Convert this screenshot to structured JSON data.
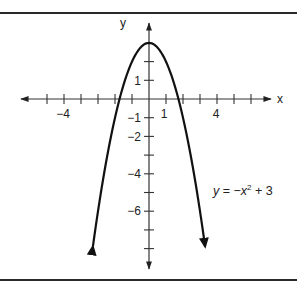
{
  "chart_data": {
    "type": "line",
    "title": "",
    "xlabel": "x",
    "ylabel": "y",
    "xlim": [
      -6.8,
      7.2
    ],
    "ylim": [
      -9,
      3.8
    ],
    "x_ticks": [
      -6,
      -5,
      -4,
      -3,
      -2,
      -1,
      1,
      2,
      3,
      4,
      5,
      6
    ],
    "x_tick_labels": {
      "-4": "−4",
      "1": "1",
      "4": "4"
    },
    "y_ticks": [
      2,
      1,
      -1,
      -2,
      -3,
      -4,
      -5,
      -6,
      -7,
      -8
    ],
    "y_tick_labels": {
      "1": "1",
      "-1": "−1",
      "-2": "−2",
      "-4": "−4",
      "-6": "−6"
    },
    "grid": false,
    "series": [
      {
        "name": "y = −x² + 3",
        "equation": "y = -x^2 + 3",
        "x": [
          -3.3,
          -3,
          -2.5,
          -2,
          -1.5,
          -1,
          -0.5,
          0,
          0.5,
          1,
          1.5,
          2,
          2.5,
          3,
          3.3
        ],
        "values": [
          -7.89,
          -6,
          -3.25,
          -1,
          0.75,
          2,
          2.75,
          3,
          2.75,
          2,
          0.75,
          -1,
          -3.25,
          -6,
          -7.89
        ],
        "arrows_at_ends": true
      }
    ],
    "annotations": [
      {
        "text_parts": [
          "y",
          " = −",
          "x",
          "2",
          " + 3"
        ],
        "position": "right, below x-axis"
      }
    ]
  },
  "labels": {
    "x_axis": "x",
    "y_axis": "y",
    "eq_y": "y",
    "eq_mid": " = −",
    "eq_x": "x",
    "eq_exp": "2",
    "eq_tail": " + 3",
    "tick_x_neg4": "−4",
    "tick_x_1": "1",
    "tick_x_4": "4",
    "tick_y_1": "1",
    "tick_y_neg1": "−1",
    "tick_y_neg2": "−2",
    "tick_y_neg4": "−4",
    "tick_y_neg6": "−6"
  }
}
